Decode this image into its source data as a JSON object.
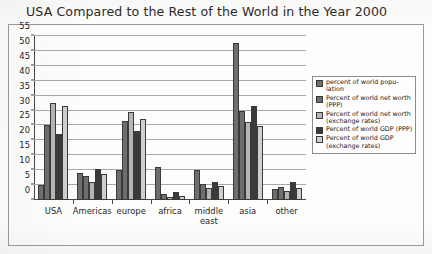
{
  "chart_data": {
    "type": "bar",
    "title": "USA Compared to the Rest of the World in the Year 2000",
    "xlabel": "",
    "ylabel": "",
    "ylim": [
      0,
      55
    ],
    "yticks": [
      0,
      5,
      10,
      15,
      20,
      25,
      30,
      35,
      40,
      45,
      50,
      55
    ],
    "grid": true,
    "legend_position": "right",
    "categories": [
      "USA",
      "Americas",
      "europe",
      "africa",
      "middle\neast",
      "asia",
      "other"
    ],
    "series": [
      {
        "name": "percent of world popu-\nlation",
        "color": "#6e6e6e",
        "values": [
          5.0,
          9.1,
          10.1,
          11.0,
          10.1,
          52.8,
          3.8
        ]
      },
      {
        "name": "Percent of world net worth\n(PPP)",
        "color": "#6e6e6e",
        "values": [
          25.2,
          8.1,
          26.6,
          2.0,
          5.3,
          30.0,
          4.3
        ]
      },
      {
        "name": "Percent of world net worth\n(exchange rates)",
        "color": "#b5b5b5",
        "values": [
          32.5,
          6.2,
          29.4,
          1.0,
          3.9,
          26.0,
          3.0
        ]
      },
      {
        "name": "Percent of world GDP (PPP)",
        "color": "#3a3a3a",
        "values": [
          22.0,
          10.5,
          23.0,
          2.8,
          6.1,
          31.5,
          6.0
        ]
      },
      {
        "name": "Percent of world GDP\n(exchange rates)",
        "color": "#cfcfcf",
        "values": [
          31.5,
          8.7,
          27.3,
          1.3,
          4.6,
          24.7,
          4.1
        ]
      }
    ]
  }
}
